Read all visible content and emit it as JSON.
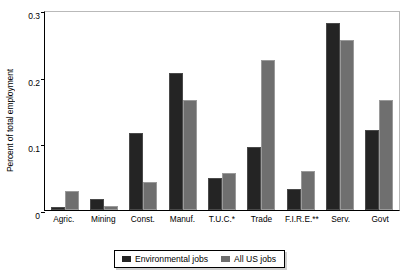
{
  "chart_data": {
    "type": "bar",
    "title": "",
    "xlabel": "",
    "ylabel": "Percent of total employment",
    "ylim": [
      0,
      0.3
    ],
    "yticks": [
      "0",
      "0.1",
      "0.2",
      "0.3"
    ],
    "ytick_values": [
      0,
      0.1,
      0.2,
      0.3
    ],
    "grid": false,
    "legend_position": "bottom",
    "categories": [
      "Agric.",
      "Mining",
      "Const.",
      "Manuf.",
      "T.U.C.*",
      "Trade",
      "F.I.R.E.**",
      "Serv.",
      "Govt"
    ],
    "series": [
      {
        "name": "Environmental jobs",
        "color": "#242424",
        "values": [
          0.005,
          0.016,
          0.115,
          0.205,
          0.048,
          0.095,
          0.031,
          0.28,
          0.12
        ]
      },
      {
        "name": "All US jobs",
        "color": "#6f6f6f",
        "values": [
          0.029,
          0.006,
          0.042,
          0.165,
          0.056,
          0.225,
          0.058,
          0.255,
          0.165
        ]
      }
    ],
    "footnotes": [
      "*",
      "**"
    ]
  }
}
